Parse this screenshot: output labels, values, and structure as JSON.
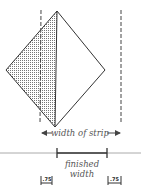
{
  "diagram": {
    "labels": {
      "width_of_strip": "width of strip",
      "finished_line1": "finished",
      "finished_line2": "width",
      "seam_left": ".75",
      "seam_right": ".75"
    },
    "colors": {
      "stroke": "#333333",
      "dashed": "#444444",
      "baseline": "#aaaaaa",
      "stipple": "#777777",
      "text": "#555555"
    }
  }
}
